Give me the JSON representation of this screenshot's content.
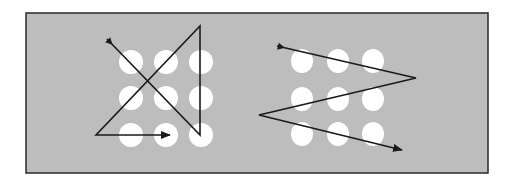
{
  "diagram": {
    "colors": {
      "background": "#ffffff",
      "panel": "#bdbdbd",
      "frame": "#2a2a2a",
      "dot": "#ffffff",
      "line": "#1a1a1a"
    },
    "frame": {
      "x": 26,
      "y": 13,
      "w": 462,
      "h": 160
    },
    "grids": [
      {
        "name": "left-grid",
        "dot_rx": 12,
        "dot_ry": 12,
        "cols": [
          131,
          166,
          201
        ],
        "rows": [
          62,
          98,
          135
        ],
        "path": [
          [
            107,
            39
          ],
          [
            200,
            135
          ],
          [
            200,
            26
          ],
          [
            96,
            135
          ],
          [
            170,
            135
          ]
        ]
      },
      {
        "name": "right-grid",
        "dot_rx": 11,
        "dot_ry": 12,
        "cols": [
          302,
          338,
          373
        ],
        "rows": [
          61,
          99,
          134
        ],
        "path": [
          [
            277,
            46
          ],
          [
            416,
            78
          ],
          [
            259,
            115
          ],
          [
            402,
            150
          ]
        ]
      }
    ]
  }
}
